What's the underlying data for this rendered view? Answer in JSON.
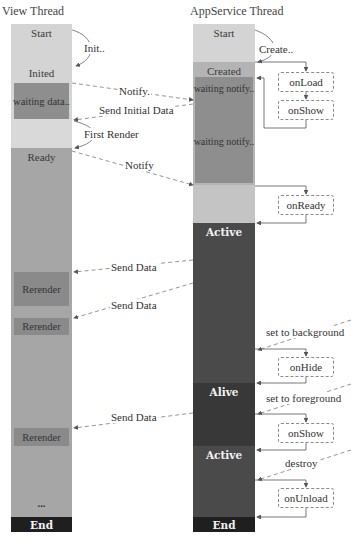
{
  "titles": {
    "view": "View Thread",
    "appservice": "AppService Thread"
  },
  "view_thread": {
    "segments": [
      {
        "label": "Start",
        "color": "#d4d4d4"
      },
      {
        "label": "Inited",
        "color": "#d4d4d4"
      },
      {
        "label": "",
        "color": "#d4d4d4"
      },
      {
        "label": "Ready",
        "color": "#a6a6a6"
      },
      {
        "label": "End",
        "color": "#1f1f1f"
      }
    ],
    "blocks": [
      {
        "label": "waiting data..",
        "color": "#8e8e8e"
      },
      {
        "label": "Rerender",
        "color": "#8a8a8a"
      },
      {
        "label": "Rerender",
        "color": "#8a8a8a"
      },
      {
        "label": "Rerender",
        "color": "#8a8a8a"
      }
    ],
    "ellipsis": "..."
  },
  "appservice_thread": {
    "segments": [
      {
        "label": "Start",
        "color": "#d4d4d4"
      },
      {
        "label": "Created",
        "color": "#b4b4b4"
      },
      {
        "label": "",
        "color": "#c4c4c4"
      },
      {
        "label": "Active",
        "color": "#4a4a4a"
      },
      {
        "label": "Alive",
        "color": "#3a3a3a"
      },
      {
        "label": "Active",
        "color": "#4a4a4a"
      },
      {
        "label": "End",
        "color": "#1f1f1f"
      }
    ],
    "blocks": [
      {
        "label": "waiting notify..",
        "color": "#8e8e8e"
      },
      {
        "label": "waiting notify..",
        "color": "#8e8e8e"
      }
    ]
  },
  "hooks": [
    "onLoad",
    "onShow",
    "onReady",
    "onHide",
    "onShow",
    "onUnload"
  ],
  "messages": {
    "init": "Init..",
    "create": "Create..",
    "notify1": "Notify.",
    "send_initial": "Send Initial Data",
    "first_render": "First Render",
    "notify2": "Notify",
    "send_data_1": "Send Data",
    "send_data_2": "Send Data",
    "send_data_3": "Send Data",
    "set_background": "set to background",
    "set_foreground": "set to foreground",
    "destroy": "destroy"
  },
  "colors": {
    "line": "#555555",
    "dashed": "#7a7a7a"
  }
}
